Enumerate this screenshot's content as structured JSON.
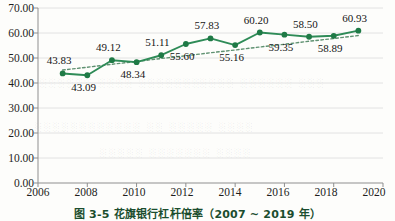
{
  "caption": {
    "figure_number": "图 3-5",
    "text": "花旗银行杠杆倍率（2007 ~ 2019 年）",
    "full": "图 3-5  花旗银行杠杆倍率（2007 ~ 2019 年）"
  },
  "colors": {
    "series_green": "#2e8b57",
    "marker_green": "#1f7a46",
    "trend_dotted": "#5a8f6e",
    "grid": "#e2e2e2",
    "axis": "#9a9a9a",
    "text": "#151515"
  },
  "chart_data": {
    "type": "line",
    "title": "",
    "xlabel": "",
    "ylabel": "",
    "xlim": [
      2006,
      2020
    ],
    "ylim": [
      0,
      70
    ],
    "grid": true,
    "legend": "none",
    "x_ticks": [
      "2006",
      "2008",
      "2010",
      "2012",
      "2014",
      "2016",
      "2018",
      "2020"
    ],
    "y_ticks": [
      "0.00",
      "10.00",
      "20.00",
      "30.00",
      "40.00",
      "50.00",
      "60.00",
      "70.00"
    ],
    "x": [
      2007,
      2008,
      2009,
      2010,
      2011,
      2012,
      2013,
      2014,
      2015,
      2016,
      2017,
      2018,
      2019
    ],
    "series": [
      {
        "name": "花旗银行杠杆倍率",
        "style": "solid-with-markers",
        "values": [
          43.83,
          43.09,
          49.12,
          48.34,
          51.11,
          55.6,
          57.83,
          55.16,
          60.2,
          59.35,
          58.5,
          58.89,
          60.93
        ]
      },
      {
        "name": "趋势线",
        "style": "dotted",
        "values": [
          45.2,
          46.3,
          47.5,
          48.6,
          49.8,
          50.9,
          52.1,
          53.2,
          54.4,
          55.5,
          56.7,
          57.8,
          59.0
        ]
      }
    ],
    "point_labels": [
      {
        "x": 2007,
        "value": "43.83",
        "position": "above"
      },
      {
        "x": 2008,
        "value": "43.09",
        "position": "below"
      },
      {
        "x": 2009,
        "value": "49.12",
        "position": "above"
      },
      {
        "x": 2010,
        "value": "48.34",
        "position": "below"
      },
      {
        "x": 2011,
        "value": "51.11",
        "position": "above"
      },
      {
        "x": 2012,
        "value": "55.60",
        "position": "below"
      },
      {
        "x": 2013,
        "value": "57.83",
        "position": "above"
      },
      {
        "x": 2014,
        "value": "55.16",
        "position": "below"
      },
      {
        "x": 2015,
        "value": "60.20",
        "position": "above"
      },
      {
        "x": 2016,
        "value": "59.35",
        "position": "below"
      },
      {
        "x": 2017,
        "value": "58.50",
        "position": "above"
      },
      {
        "x": 2018,
        "value": "58.89",
        "position": "below"
      },
      {
        "x": 2019,
        "value": "60.93",
        "position": "above"
      }
    ]
  }
}
